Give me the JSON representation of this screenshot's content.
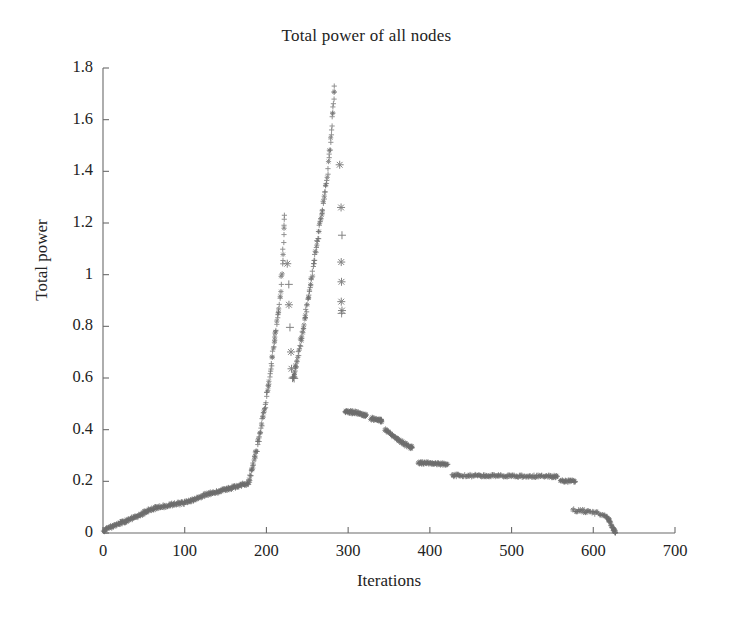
{
  "figure": {
    "title": "Total power of all nodes",
    "xlabel": "Iterations",
    "ylabel": "Total power",
    "background": "#ffffff",
    "axis_color": "#6b6b6b",
    "marker_color": "#6e6e6e",
    "text_color": "#232323"
  },
  "axes": {
    "x_ticks": [
      "0",
      "100",
      "200",
      "300",
      "400",
      "500",
      "600",
      "700"
    ],
    "y_ticks": [
      "0",
      "0.2",
      "0.4",
      "0.6",
      "0.8",
      "1",
      "1.2",
      "1.4",
      "1.6",
      "1.8"
    ]
  },
  "chart_data": {
    "type": "scatter",
    "title": "Total power of all nodes",
    "xlabel": "Iterations",
    "ylabel": "Total power",
    "xlim": [
      0,
      700
    ],
    "ylim": [
      0,
      1.8
    ],
    "xticks": [
      0,
      100,
      200,
      300,
      400,
      500,
      600,
      700
    ],
    "yticks": [
      0,
      0.2,
      0.4,
      0.6,
      0.8,
      1.0,
      1.2,
      1.4,
      1.6,
      1.8
    ],
    "grid": false,
    "legend": null,
    "markers": [
      "plus",
      "asterisk"
    ],
    "series": [
      {
        "name": "Total power",
        "description": "Dense scatter of '+' and '*' markers tracing a slow rise, two steep ramps with sharp drops, a stepped decay, a long plateau, then a final decline to zero.",
        "segments": [
          {
            "name": "slow-rise",
            "comment": "Gradual noisy climb from 0 to about 0.19 over iterations 0-175",
            "points": [
              [
                0,
                0.005
              ],
              [
                3,
                0.012
              ],
              [
                6,
                0.018
              ],
              [
                9,
                0.022
              ],
              [
                12,
                0.026
              ],
              [
                15,
                0.03
              ],
              [
                18,
                0.034
              ],
              [
                21,
                0.038
              ],
              [
                24,
                0.041
              ],
              [
                27,
                0.045
              ],
              [
                30,
                0.049
              ],
              [
                33,
                0.053
              ],
              [
                36,
                0.057
              ],
              [
                39,
                0.06
              ],
              [
                42,
                0.064
              ],
              [
                45,
                0.069
              ],
              [
                48,
                0.075
              ],
              [
                51,
                0.081
              ],
              [
                54,
                0.086
              ],
              [
                57,
                0.09
              ],
              [
                60,
                0.093
              ],
              [
                63,
                0.096
              ],
              [
                66,
                0.098
              ],
              [
                69,
                0.1
              ],
              [
                72,
                0.102
              ],
              [
                75,
                0.104
              ],
              [
                78,
                0.106
              ],
              [
                81,
                0.108
              ],
              [
                84,
                0.11
              ],
              [
                87,
                0.112
              ],
              [
                90,
                0.113
              ],
              [
                93,
                0.114
              ],
              [
                96,
                0.115
              ],
              [
                99,
                0.116
              ],
              [
                102,
                0.118
              ],
              [
                105,
                0.121
              ],
              [
                108,
                0.125
              ],
              [
                111,
                0.129
              ],
              [
                114,
                0.133
              ],
              [
                117,
                0.137
              ],
              [
                120,
                0.141
              ],
              [
                123,
                0.145
              ],
              [
                126,
                0.149
              ],
              [
                129,
                0.152
              ],
              [
                132,
                0.155
              ],
              [
                135,
                0.157
              ],
              [
                138,
                0.159
              ],
              [
                141,
                0.161
              ],
              [
                144,
                0.163
              ],
              [
                147,
                0.165
              ],
              [
                150,
                0.167
              ],
              [
                153,
                0.17
              ],
              [
                156,
                0.173
              ],
              [
                159,
                0.176
              ],
              [
                162,
                0.179
              ],
              [
                165,
                0.182
              ],
              [
                168,
                0.185
              ],
              [
                171,
                0.188
              ],
              [
                174,
                0.19
              ],
              [
                177,
                0.192
              ]
            ]
          },
          {
            "name": "ramp-1",
            "comment": "Steep first ramp from 0.19 at iteration 178 up to peak 1.23 at iteration 222",
            "points": [
              [
                178,
                0.195
              ],
              [
                180,
                0.215
              ],
              [
                182,
                0.24
              ],
              [
                184,
                0.265
              ],
              [
                186,
                0.292
              ],
              [
                188,
                0.32
              ],
              [
                190,
                0.35
              ],
              [
                192,
                0.382
              ],
              [
                194,
                0.415
              ],
              [
                196,
                0.45
              ],
              [
                198,
                0.487
              ],
              [
                200,
                0.525
              ],
              [
                202,
                0.565
              ],
              [
                204,
                0.607
              ],
              [
                206,
                0.65
              ],
              [
                208,
                0.695
              ],
              [
                210,
                0.74
              ],
              [
                212,
                0.787
              ],
              [
                214,
                0.835
              ],
              [
                216,
                0.885
              ],
              [
                218,
                0.96
              ],
              [
                220,
                1.06
              ],
              [
                221,
                1.15
              ],
              [
                222,
                1.23
              ]
            ]
          },
          {
            "name": "drop-1",
            "comment": "Sparse '*' markers falling from 1.05 to 0.60 around iterations 226-232",
            "points": [
              [
                226,
                1.045
              ],
              [
                227,
                0.96
              ],
              [
                228,
                0.88
              ],
              [
                229,
                0.79
              ],
              [
                230,
                0.7
              ],
              [
                231,
                0.64
              ],
              [
                232,
                0.608
              ],
              [
                233,
                0.6
              ],
              [
                234,
                0.598
              ]
            ]
          },
          {
            "name": "ramp-2",
            "comment": "Second steep ramp from 0.60 at iteration 233 to the global peak 1.73 at iteration 283",
            "points": [
              [
                233,
                0.6
              ],
              [
                235,
                0.625
              ],
              [
                237,
                0.655
              ],
              [
                239,
                0.688
              ],
              [
                241,
                0.722
              ],
              [
                243,
                0.757
              ],
              [
                245,
                0.793
              ],
              [
                247,
                0.83
              ],
              [
                249,
                0.868
              ],
              [
                251,
                0.906
              ],
              [
                253,
                0.944
              ],
              [
                255,
                0.983
              ],
              [
                257,
                1.022
              ],
              [
                259,
                1.061
              ],
              [
                261,
                1.1
              ],
              [
                263,
                1.14
              ],
              [
                265,
                1.18
              ],
              [
                267,
                1.22
              ],
              [
                269,
                1.262
              ],
              [
                271,
                1.305
              ],
              [
                273,
                1.35
              ],
              [
                275,
                1.4
              ],
              [
                277,
                1.455
              ],
              [
                279,
                1.52
              ],
              [
                281,
                1.6
              ],
              [
                282,
                1.672
              ],
              [
                283,
                1.73
              ]
            ]
          },
          {
            "name": "drop-2",
            "comment": "Sparse descending column of '*' markers from 1.42 down to 0.85 near iteration 292",
            "points": [
              [
                290,
                1.42
              ],
              [
                291,
                1.27
              ],
              [
                292,
                1.16
              ],
              [
                292,
                1.06
              ],
              [
                292,
                0.975
              ],
              [
                292,
                0.905
              ],
              [
                292,
                0.862
              ],
              [
                292,
                0.85
              ]
            ]
          },
          {
            "name": "plateau-047",
            "comment": "Flat band just under 0.47 for iterations 296-322",
            "points": [
              [
                296,
                0.468
              ],
              [
                300,
                0.47
              ],
              [
                304,
                0.468
              ],
              [
                308,
                0.466
              ],
              [
                312,
                0.464
              ],
              [
                316,
                0.461
              ],
              [
                320,
                0.458
              ],
              [
                322,
                0.456
              ]
            ]
          },
          {
            "name": "plateau-044",
            "comment": "Short band at 0.44 for iterations 328-341",
            "points": [
              [
                328,
                0.443
              ],
              [
                332,
                0.441
              ],
              [
                336,
                0.438
              ],
              [
                340,
                0.435
              ],
              [
                341,
                0.434
              ]
            ]
          },
          {
            "name": "decay-step",
            "comment": "Descending run from 0.40 to 0.33 for iterations 345-378",
            "points": [
              [
                345,
                0.4
              ],
              [
                349,
                0.392
              ],
              [
                353,
                0.383
              ],
              [
                357,
                0.373
              ],
              [
                361,
                0.362
              ],
              [
                365,
                0.352
              ],
              [
                369,
                0.344
              ],
              [
                373,
                0.337
              ],
              [
                377,
                0.332
              ],
              [
                378,
                0.331
              ]
            ]
          },
          {
            "name": "plateau-027",
            "comment": "Flat band at 0.27 for iterations 386-422",
            "points": [
              [
                386,
                0.272
              ],
              [
                392,
                0.271
              ],
              [
                398,
                0.27
              ],
              [
                404,
                0.269
              ],
              [
                410,
                0.268
              ],
              [
                416,
                0.267
              ],
              [
                422,
                0.266
              ]
            ]
          },
          {
            "name": "plateau-022",
            "comment": "Long flat plateau at about 0.22 from iteration 427 to 556",
            "points": [
              [
                427,
                0.223
              ],
              [
                440,
                0.223
              ],
              [
                455,
                0.222
              ],
              [
                470,
                0.222
              ],
              [
                485,
                0.221
              ],
              [
                500,
                0.221
              ],
              [
                515,
                0.22
              ],
              [
                530,
                0.22
              ],
              [
                545,
                0.219
              ],
              [
                556,
                0.219
              ]
            ]
          },
          {
            "name": "plateau-020",
            "comment": "Short step at 0.20 from iteration 560 to 578",
            "points": [
              [
                560,
                0.202
              ],
              [
                566,
                0.201
              ],
              [
                572,
                0.2
              ],
              [
                578,
                0.199
              ]
            ]
          },
          {
            "name": "tail-decline",
            "comment": "Lower band near 0.085 sloping down and finally collapsing to zero at iteration 627",
            "points": [
              [
                575,
                0.088
              ],
              [
                582,
                0.087
              ],
              [
                589,
                0.085
              ],
              [
                596,
                0.082
              ],
              [
                603,
                0.078
              ],
              [
                610,
                0.073
              ],
              [
                615,
                0.066
              ],
              [
                618,
                0.056
              ],
              [
                620,
                0.044
              ],
              [
                622,
                0.03
              ],
              [
                624,
                0.018
              ],
              [
                626,
                0.007
              ],
              [
                627,
                0.002
              ]
            ]
          }
        ]
      }
    ]
  }
}
